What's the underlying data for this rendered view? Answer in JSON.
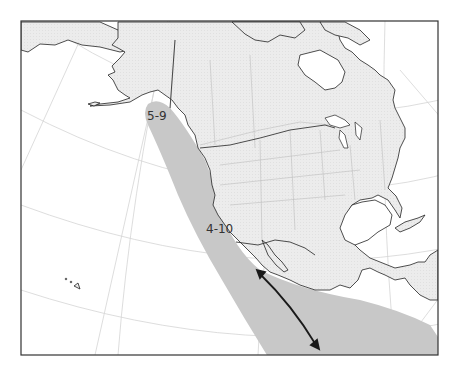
{
  "map": {
    "type": "range-map",
    "region": "North America and eastern Pacific Ocean",
    "colors": {
      "ocean": "#ffffff",
      "land": "#ececec",
      "range_shading": "#c8c8c8",
      "coastline": "#222222",
      "borders": "#bdbdbd",
      "graticule": "#d4d4d4",
      "frame": "#333333",
      "arrow": "#1a1a1a"
    },
    "labels": [
      {
        "id": "north",
        "text": "5-9"
      },
      {
        "id": "south",
        "text": "4-10"
      }
    ],
    "arrow": {
      "type": "double-headed",
      "description": "migration direction along Pacific coast of Mexico"
    }
  }
}
